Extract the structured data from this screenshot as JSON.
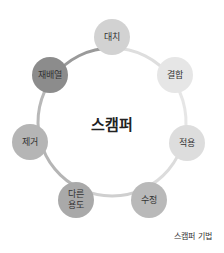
{
  "diagram": {
    "center_label": "스캠퍼",
    "caption": "스캠퍼 기법",
    "ring": {
      "cx": 112,
      "cy": 122,
      "r": 74,
      "segments": [
        {
          "from": "대치",
          "to": "결합",
          "color": "#dedede"
        },
        {
          "from": "결합",
          "to": "적용",
          "color": "#e6e6e6"
        },
        {
          "from": "적용",
          "to": "수정",
          "color": "#dcdcdc"
        },
        {
          "from": "수정",
          "to": "다른 용도",
          "color": "#cfcfcf"
        },
        {
          "from": "다른 용도",
          "to": "제거",
          "color": "#b5b5b5"
        },
        {
          "from": "제거",
          "to": "재배열",
          "color": "#b8b8b8"
        },
        {
          "from": "재배열",
          "to": "대치",
          "color": "#9a9a9a"
        }
      ]
    },
    "nodes": [
      {
        "id": "substitute",
        "label_line1": "대치",
        "label_line2": "",
        "x": 112,
        "y": 37,
        "color": "#d2d2d2"
      },
      {
        "id": "combine",
        "label_line1": "결합",
        "label_line2": "",
        "x": 175,
        "y": 75,
        "color": "#e6e6e6"
      },
      {
        "id": "adapt",
        "label_line1": "적용",
        "label_line2": "",
        "x": 187,
        "y": 143,
        "color": "#dddddd"
      },
      {
        "id": "modify",
        "label_line1": "수정",
        "label_line2": "",
        "x": 149,
        "y": 200,
        "color": "#b9b9b9"
      },
      {
        "id": "put-to-other-use",
        "label_line1": "다른",
        "label_line2": "용도",
        "x": 76,
        "y": 200,
        "color": "#a9a9a9"
      },
      {
        "id": "eliminate",
        "label_line1": "제거",
        "label_line2": "",
        "x": 30,
        "y": 142,
        "color": "#b5b5b5"
      },
      {
        "id": "rearrange",
        "label_line1": "재배열",
        "label_line2": "",
        "x": 50,
        "y": 75,
        "color": "#8c8c8c"
      }
    ]
  }
}
